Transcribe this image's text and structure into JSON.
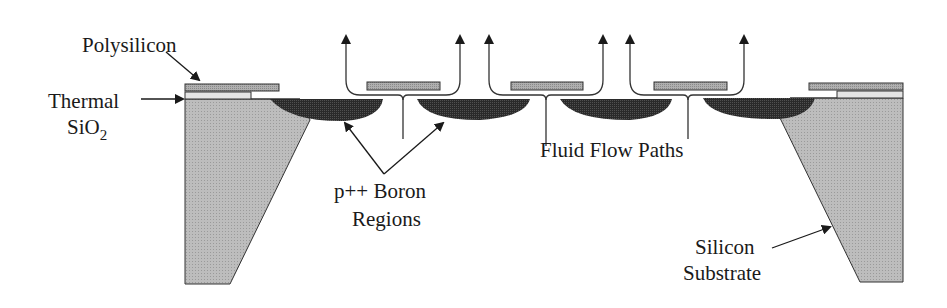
{
  "diagram": {
    "type": "cross-section",
    "colors": {
      "substrate": "#b8b8b8",
      "polysilicon": "#a9a9a9",
      "oxide": "#e4e4e4",
      "boron": "#262626",
      "outline": "#333333",
      "text": "#1a1a1a"
    },
    "labels": {
      "polysilicon": "Polysilicon",
      "thermal": "Thermal",
      "sio2_base": "SiO",
      "sio2_sub": "2",
      "boron_line1": "p++ Boron",
      "boron_line2": "Regions",
      "flow": "Fluid Flow Paths",
      "silicon_line1": "Silicon",
      "silicon_line2": "Substrate"
    }
  }
}
